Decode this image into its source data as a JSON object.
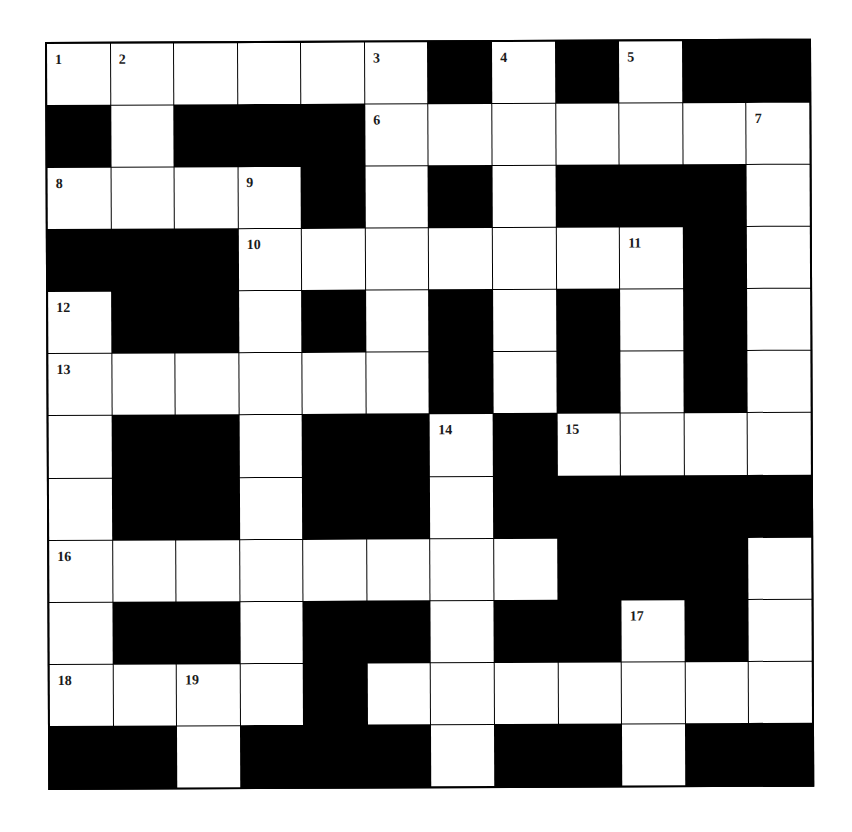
{
  "puzzle": {
    "rows": 12,
    "cols": 12,
    "colors": {
      "block": "#000000",
      "open": "#ffffff",
      "label": "#1a1a1a"
    },
    "grid": [
      "......#.#.##",
      "#.###.......",
      "....#.#.###.",
      "###.......#.",
      ".##.#.#.#.#.",
      "......#.#.#.",
      ".##.##.#....",
      ".##.##.#####",
      "........###.",
      ".##.##.##.#.",
      "....#.......",
      "##.###.##.##"
    ],
    "numbers": [
      {
        "r": 0,
        "c": 0,
        "n": "1"
      },
      {
        "r": 0,
        "c": 1,
        "n": "2"
      },
      {
        "r": 0,
        "c": 5,
        "n": "3"
      },
      {
        "r": 0,
        "c": 7,
        "n": "4"
      },
      {
        "r": 0,
        "c": 9,
        "n": "5"
      },
      {
        "r": 1,
        "c": 5,
        "n": "6"
      },
      {
        "r": 1,
        "c": 11,
        "n": "7"
      },
      {
        "r": 2,
        "c": 0,
        "n": "8"
      },
      {
        "r": 2,
        "c": 3,
        "n": "9"
      },
      {
        "r": 3,
        "c": 3,
        "n": "10"
      },
      {
        "r": 3,
        "c": 9,
        "n": "11"
      },
      {
        "r": 4,
        "c": 0,
        "n": "12"
      },
      {
        "r": 5,
        "c": 0,
        "n": "13"
      },
      {
        "r": 6,
        "c": 6,
        "n": "14"
      },
      {
        "r": 6,
        "c": 8,
        "n": "15"
      },
      {
        "r": 8,
        "c": 0,
        "n": "16"
      },
      {
        "r": 9,
        "c": 9,
        "n": "17"
      },
      {
        "r": 10,
        "c": 0,
        "n": "18"
      },
      {
        "r": 10,
        "c": 2,
        "n": "19"
      },
      {
        "r": 10,
        "c": 4,
        "n": "20"
      }
    ]
  }
}
